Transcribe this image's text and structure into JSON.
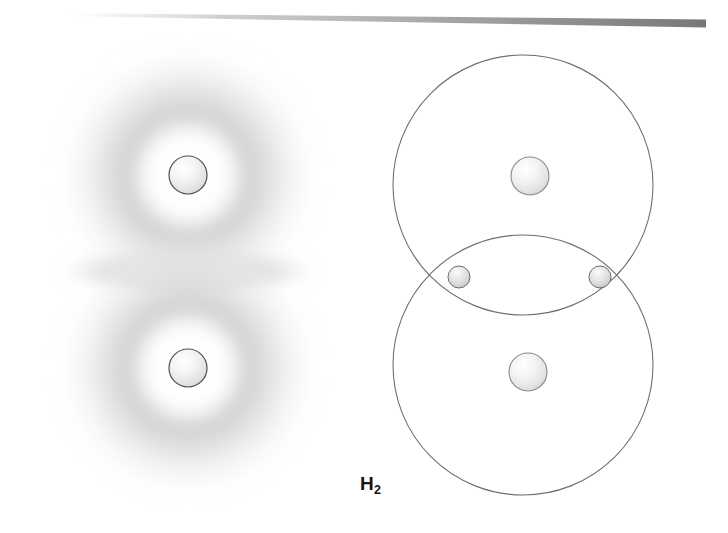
{
  "figure": {
    "title": "H2",
    "caption_label": "H",
    "caption_subscript": "2",
    "width": 728,
    "height": 533,
    "background_color": "#ffffff"
  },
  "header_rule": {
    "name": "top-gradient-rule",
    "left_color": "#fcfcfc",
    "mid_color": "#c9c9c9",
    "right_color": "#7d7d7d",
    "x_start": 60,
    "x_end": 706,
    "y_start": 12,
    "y_end": 24,
    "thickness_left": 3,
    "thickness_right": 8
  },
  "panels": [
    {
      "name": "electron-cloud-panel",
      "kind": "electron-density-cloud",
      "description": "Hydrogen molecule shown as two overlapping fuzzy electron clouds",
      "atoms": [
        {
          "name": "upper-atom",
          "nucleus_cx": 188,
          "nucleus_cy": 175,
          "nucleus_r": 19,
          "cloud_cx": 188,
          "cloud_cy": 175,
          "cloud_r": 130
        },
        {
          "name": "lower-atom",
          "nucleus_cx": 188,
          "nucleus_cy": 368,
          "nucleus_r": 19,
          "cloud_cx": 188,
          "cloud_cy": 368,
          "cloud_r": 130
        }
      ],
      "overlap_region": {
        "name": "bond-overlap-lens",
        "cx": 188,
        "cy": 271,
        "rx": 132,
        "ry": 28,
        "color": "#c7c7c7"
      },
      "cloud_color": "#d2d2d2",
      "halo_color": "#ffffff",
      "nucleus_fill": "#f2f2f2",
      "nucleus_stroke": "#4a4a4a"
    },
    {
      "name": "orbital-shell-panel",
      "kind": "bohr-shell-overlap",
      "description": "Hydrogen molecule shown as two overlapping circular shells with shared electrons",
      "shells": [
        {
          "name": "upper-shell-circle",
          "cx": 523,
          "cy": 185,
          "r": 130,
          "stroke": "#6f6f6f",
          "stroke_width": 1.1
        },
        {
          "name": "lower-shell-circle",
          "cx": 523,
          "cy": 365,
          "r": 130,
          "stroke": "#6f6f6f",
          "stroke_width": 1.1
        }
      ],
      "nuclei": [
        {
          "name": "upper-nucleus",
          "cx": 530,
          "cy": 176,
          "r": 19
        },
        {
          "name": "lower-nucleus",
          "cx": 528,
          "cy": 372,
          "r": 19
        }
      ],
      "electrons": [
        {
          "name": "left-shared-electron",
          "cx": 459,
          "cy": 277,
          "r": 11
        },
        {
          "name": "right-shared-electron",
          "cx": 600,
          "cy": 277,
          "r": 11
        }
      ],
      "nucleus_fill": "#f4f4f4",
      "nucleus_stroke": "#7a7a7a",
      "electron_fill": "#d8d8d8",
      "electron_stroke": "#707070"
    }
  ],
  "caption": {
    "name": "molecule-formula-label",
    "text": "H2",
    "x": 360,
    "y": 474
  }
}
